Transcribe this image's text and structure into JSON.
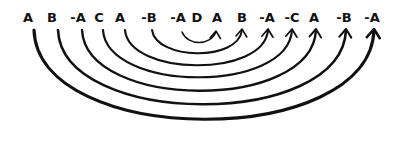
{
  "diagram": {
    "tokens": [
      {
        "label": "A",
        "x": 28
      },
      {
        "label": "B",
        "x": 52
      },
      {
        "label": "-A",
        "x": 78
      },
      {
        "label": "C",
        "x": 99
      },
      {
        "label": "A",
        "x": 120
      },
      {
        "label": "-B",
        "x": 149
      },
      {
        "label": "-A",
        "x": 178
      },
      {
        "label": "D",
        "x": 197
      },
      {
        "label": "A",
        "x": 217
      },
      {
        "label": "B",
        "x": 242
      },
      {
        "label": "-A",
        "x": 267
      },
      {
        "label": "-C",
        "x": 292
      },
      {
        "label": "A",
        "x": 314
      },
      {
        "label": "-B",
        "x": 344
      },
      {
        "label": "-A",
        "x": 372
      }
    ],
    "arcs": [
      {
        "from": 6,
        "to": 8,
        "x1": 182,
        "x2": 216,
        "depth": 14,
        "width": 1.6,
        "arrow": true
      },
      {
        "from": 5,
        "to": 9,
        "x1": 152,
        "x2": 242,
        "depth": 30,
        "width": 2.0,
        "arrow": true
      },
      {
        "from": 4,
        "to": 10,
        "x1": 125,
        "x2": 268,
        "depth": 46,
        "width": 2.2,
        "arrow": true
      },
      {
        "from": 3,
        "to": 11,
        "x1": 103,
        "x2": 292,
        "depth": 62,
        "width": 2.2,
        "arrow": true
      },
      {
        "from": 2,
        "to": 12,
        "x1": 82,
        "x2": 316,
        "depth": 80,
        "width": 2.4,
        "arrow": true
      },
      {
        "from": 1,
        "to": 13,
        "x1": 58,
        "x2": 346,
        "depth": 98,
        "width": 2.6,
        "arrow": true
      },
      {
        "from": 0,
        "to": 14,
        "x1": 34,
        "x2": 374,
        "depth": 118,
        "width": 3.2,
        "arrow": true
      }
    ],
    "color": "#111111"
  }
}
